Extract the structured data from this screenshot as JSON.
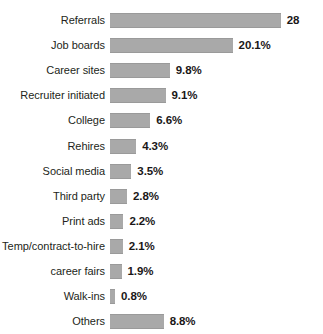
{
  "chart_data": {
    "type": "bar",
    "orientation": "horizontal",
    "title": "",
    "subtitle": "",
    "xlabel": "",
    "ylabel": "",
    "grid": false,
    "legend": null,
    "xlim": [
      0,
      28
    ],
    "bar_color": "#a9a9a9",
    "bar_edge_color": "#9a9a9a",
    "label_color": "#231f20",
    "value_color": "#1a1718",
    "background": "#ffffff",
    "categories": [
      "Referrals",
      "Job boards",
      "Career sites",
      "Recruiter initiated",
      "College",
      "Rehires",
      "Social media",
      "Third party",
      "Print ads",
      "Temp/contract-to-hire",
      "career fairs",
      "Walk-ins",
      "Others"
    ],
    "values": [
      28,
      20.1,
      9.8,
      9.1,
      6.6,
      4.3,
      3.5,
      2.8,
      2.2,
      2.1,
      1.9,
      0.8,
      8.8
    ],
    "value_labels": [
      "28",
      "20.1%",
      "9.8%",
      "9.1%",
      "6.6%",
      "4.3%",
      "3.5%",
      "2.8%",
      "2.2%",
      "2.1%",
      "1.9%",
      "0.8%",
      "8.8%"
    ],
    "rows": [
      {
        "label": "Referrals",
        "value": 28,
        "value_label": "28"
      },
      {
        "label": "Job boards",
        "value": 20.1,
        "value_label": "20.1%"
      },
      {
        "label": "Career sites",
        "value": 9.8,
        "value_label": "9.8%"
      },
      {
        "label": "Recruiter initiated",
        "value": 9.1,
        "value_label": "9.1%"
      },
      {
        "label": "College",
        "value": 6.6,
        "value_label": "6.6%"
      },
      {
        "label": "Rehires",
        "value": 4.3,
        "value_label": "4.3%"
      },
      {
        "label": "Social media",
        "value": 3.5,
        "value_label": "3.5%"
      },
      {
        "label": "Third party",
        "value": 2.8,
        "value_label": "2.8%"
      },
      {
        "label": "Print ads",
        "value": 2.2,
        "value_label": "2.2%"
      },
      {
        "label": "Temp/contract-to-hire",
        "value": 2.1,
        "value_label": "2.1%"
      },
      {
        "label": "career fairs",
        "value": 1.9,
        "value_label": "1.9%"
      },
      {
        "label": "Walk-ins",
        "value": 0.8,
        "value_label": "0.8%"
      },
      {
        "label": "Others",
        "value": 8.8,
        "value_label": "8.8%"
      }
    ]
  },
  "layout": {
    "px_per_unit": 6.1,
    "min_bar_px": 5
  }
}
